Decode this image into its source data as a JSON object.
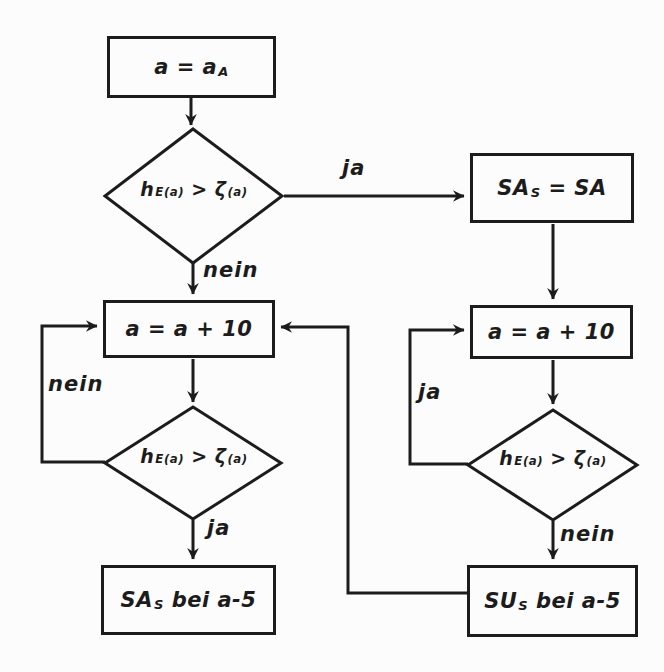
{
  "colors": {
    "ink": "#1c1c1c",
    "bg": "#fcfcfc"
  },
  "nodes": {
    "start": {
      "pre": "a = a",
      "sub": "A"
    },
    "condition": {
      "p1": "h",
      "s1": "E(a)",
      "p2": " > ζ",
      "s2": "(a)"
    },
    "assign_sas": {
      "pre": "SA",
      "sub": "S",
      "post": " = SA"
    },
    "increment": {
      "text": "a = a + 10"
    },
    "result_sa": {
      "pre": "SA",
      "sub": "S",
      "post": " bei a-5"
    },
    "result_su": {
      "pre": "SU",
      "sub": "S",
      "post": " bei a-5"
    }
  },
  "labels": {
    "ja_decision1": "ja",
    "nein_decision1": "nein",
    "nein_loop_left": "nein",
    "ja_decision2": "ja",
    "ja_loop_right": "ja",
    "nein_decision3": "nein"
  }
}
